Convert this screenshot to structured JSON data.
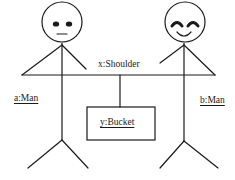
{
  "diagram": {
    "type": "UML collaboration / object diagram",
    "objects": [
      {
        "id": "a",
        "label": "a:Man",
        "face": "neutral"
      },
      {
        "id": "b",
        "label": "b:Man",
        "face": "smiling"
      },
      {
        "id": "x",
        "label": "x:Shoulder"
      },
      {
        "id": "y",
        "label": "y:Bucket"
      }
    ],
    "links": [
      {
        "from": "a",
        "to": "x"
      },
      {
        "from": "b",
        "to": "x"
      },
      {
        "from": "x",
        "to": "y"
      }
    ],
    "labels": {
      "shoulder": "x:Shoulder",
      "man_a": "a:Man",
      "man_b": "b:Man",
      "bucket": "y:Bucket"
    },
    "colors": {
      "stroke": "#1a1a1a",
      "background": "#ffffff"
    }
  }
}
